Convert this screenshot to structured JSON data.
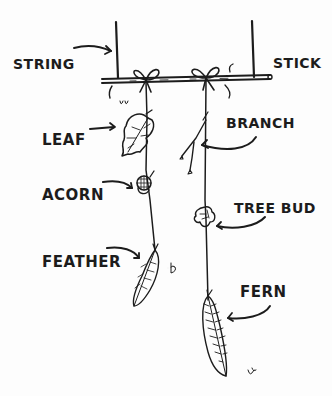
{
  "diagram": {
    "type": "labeled-illustration",
    "ink_color": "#1c1c1c",
    "background_color": "#fdfdfd",
    "labels": {
      "string": "STRING",
      "stick": "STICK",
      "leaf": "LEAF",
      "branch": "BRANCH",
      "acorn": "ACORN",
      "tree_bud": "TREE BUD",
      "feather": "FEATHER",
      "fern": "FERN"
    },
    "strands": [
      {
        "name": "left-strand",
        "items_top_to_bottom": [
          "leaf",
          "acorn",
          "feather"
        ]
      },
      {
        "name": "right-strand",
        "items_top_to_bottom": [
          "branch",
          "tree_bud",
          "fern"
        ]
      }
    ]
  }
}
